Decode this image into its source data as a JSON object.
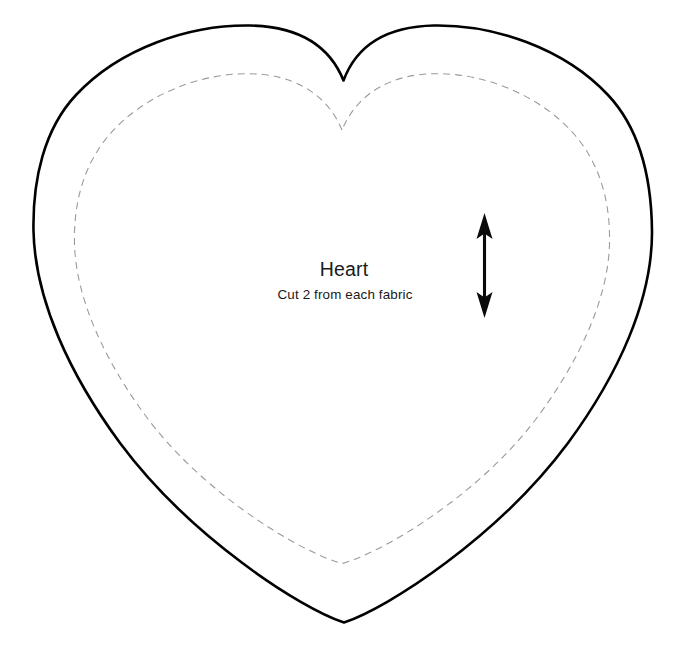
{
  "document": {
    "kind": "sewing-pattern-template",
    "shape_name": "Heart",
    "background_color": "#ffffff",
    "canvas": {
      "width": 687,
      "height": 666
    }
  },
  "labels": {
    "title": "Heart",
    "instruction": "Cut 2 from each fabric",
    "title_x": 344,
    "title_y": 276,
    "instruction_x": 345,
    "instruction_y": 299
  },
  "cut_line": {
    "name": "cutting-line",
    "style": "solid",
    "color": "#000000",
    "stroke_width": 2.6,
    "left_x": 33,
    "right_x": 652,
    "lobe_top_y": 25,
    "notch_x": 343,
    "notch_y": 80,
    "bottom_point_x": 344,
    "bottom_point_y": 622,
    "path": "M 343.5 80.5 C 330 47 300 26.5 250 25.5 C 190 24.5 120 48 76 95 C 44 129 32.5 180 33.5 231 C 35 300 70 375 120 443 C 190 537 300 608 344 622.5 C 388 608 498 537 568 443 C 618 375 652.5 300 652 231 C 651.5 180 640 129 608 95 C 564 48 494 24.5 434 25.5 C 384 26.5 356 47 343.5 80.5 Z"
  },
  "seam_line": {
    "name": "seam-allowance-line",
    "style": "dashed",
    "color": "#9a9a9f",
    "stroke_width": 1.1,
    "dash_pattern": "7 5",
    "left_x": 74,
    "right_x": 610,
    "lobe_top_y": 74,
    "notch_x": 342,
    "notch_y": 130,
    "bottom_point_x": 342,
    "bottom_point_y": 563,
    "path": "M 342 130 C 331 103 306 79 263 74.5 C 209 69 147 92 110 134 C 83 165 73.5 204 74.5 244 C 76 300 106 363 148 419 C 207 497 303 553 342 563.5 C 381 553 477 497 536 419 C 578 363 608 300 609.5 244 C 610.5 204 601 165 574 134 C 537 92 475 69 421 74.5 C 378 79 353 103 342 130 Z"
  },
  "grainline": {
    "name": "grainline-arrow",
    "orientation": "vertical",
    "double_headed": true,
    "color": "#0a0a0a",
    "x": 484.5,
    "top_y": 213,
    "bottom_y": 318,
    "shaft_width": 3.1,
    "head_half_width": 8,
    "head_length": 22
  }
}
